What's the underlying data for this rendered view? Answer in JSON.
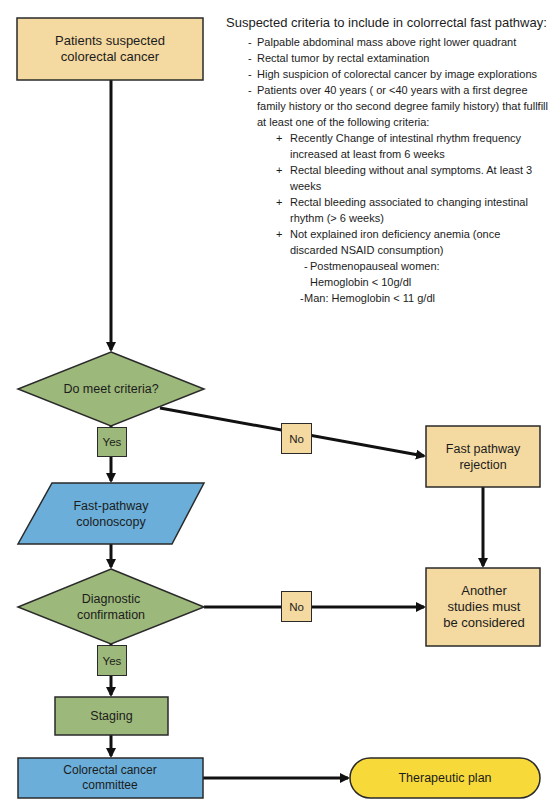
{
  "colors": {
    "process_fill": "#f4d9a0",
    "decision_fill": "#9cb87a",
    "io_fill": "#6aaed9",
    "terminal_fill": "#f7d939",
    "stroke": "#111111"
  },
  "nodes": {
    "start": {
      "label": "Patients suspected colorectal cancer",
      "type": "process"
    },
    "decision1": {
      "label": "Do meet criteria?",
      "type": "decision"
    },
    "yes1": {
      "label": "Yes"
    },
    "no1": {
      "label": "No"
    },
    "rejection": {
      "label": "Fast pathway rejection",
      "type": "process"
    },
    "colonoscopy": {
      "label": "Fast-pathway colonoscopy",
      "type": "io"
    },
    "decision2": {
      "label": "Diagnostic confirmation",
      "type": "decision"
    },
    "yes2": {
      "label": "Yes"
    },
    "no2": {
      "label": "No"
    },
    "other_studies": {
      "label": "Another studies must be considered",
      "type": "process"
    },
    "staging": {
      "label": "Staging",
      "type": "decision-colored-process"
    },
    "committee": {
      "label": "Colorectal cancer committee",
      "type": "process-blue"
    },
    "therapeutic": {
      "label": "Therapeutic plan",
      "type": "terminal"
    }
  },
  "criteria": {
    "title": "Suspected criteria to include in colorrectal fast pathway:",
    "items": [
      {
        "marker": "-",
        "text": "Palpable abdominal mass above right lower quadrant"
      },
      {
        "marker": "-",
        "text": "Rectal tumor by rectal extamination"
      },
      {
        "marker": "-",
        "text": "High suspicion of colorectal cancer by image explorations"
      },
      {
        "marker": "-",
        "text": "Patients over 40 years ( or <40 years with a first degree family history or tho second degree family history) that fullfill at least one of the following criteria:"
      }
    ],
    "subitems": [
      {
        "marker": "+",
        "text": "Recently Change of intestinal rhythm frequency increased at least from 6 weeks"
      },
      {
        "marker": "+",
        "text": "Rectal bleeding without anal symptoms. At least 3 weeks"
      },
      {
        "marker": "+",
        "text": "Rectal bleeding associated to changing intestinal rhythm (> 6 weeks)"
      },
      {
        "marker": "+",
        "text": "Not explained iron deficiency anemia (once discarded  NSAID consumption)"
      }
    ],
    "anemia_thresholds": [
      {
        "marker": "-",
        "text": "Postmenopauseal women: Hemoglobin < 10g/dl"
      },
      {
        "marker": "-",
        "text": "Man: Hemoglobin < 11 g/dl"
      }
    ]
  }
}
